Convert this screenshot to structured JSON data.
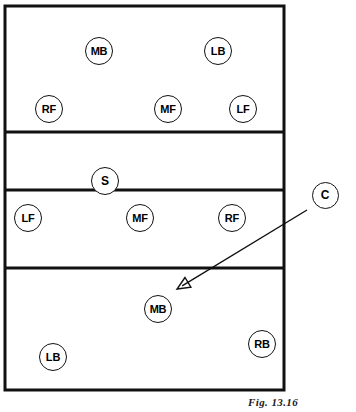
{
  "figure": {
    "caption": "Fig. 13.16"
  },
  "court": {
    "outline": {
      "x": 5,
      "y": 6,
      "width": 279,
      "height": 384
    },
    "lines": [
      {
        "name": "far-attack-line",
        "y": 132
      },
      {
        "name": "center-net-line",
        "y": 190
      },
      {
        "name": "near-attack-line",
        "y": 268
      }
    ],
    "line_color": "#111111"
  },
  "zones": [
    {
      "name": "far-back-zone",
      "top": 6,
      "bottom": 132
    },
    {
      "name": "far-front-zone",
      "top": 132,
      "bottom": 190
    },
    {
      "name": "near-front-zone",
      "top": 190,
      "bottom": 268
    },
    {
      "name": "near-back-zone",
      "top": 268,
      "bottom": 390
    }
  ],
  "players": [
    {
      "id": "far-mb",
      "label": "MB",
      "cx": 99,
      "cy": 51,
      "zone": "far-back-zone"
    },
    {
      "id": "far-lb",
      "label": "LB",
      "cx": 218,
      "cy": 51,
      "zone": "far-back-zone"
    },
    {
      "id": "far-rf",
      "label": "RF",
      "cx": 49,
      "cy": 109,
      "zone": "far-back-zone"
    },
    {
      "id": "far-mf",
      "label": "MF",
      "cx": 168,
      "cy": 109,
      "zone": "far-back-zone"
    },
    {
      "id": "far-lf",
      "label": "LF",
      "cx": 243,
      "cy": 109,
      "zone": "far-back-zone"
    },
    {
      "id": "setter",
      "label": "S",
      "cx": 105,
      "cy": 181,
      "zone": "far-front-zone"
    },
    {
      "id": "near-lf",
      "label": "LF",
      "cx": 28,
      "cy": 218,
      "zone": "near-front-zone"
    },
    {
      "id": "near-mf",
      "label": "MF",
      "cx": 140,
      "cy": 218,
      "zone": "near-front-zone"
    },
    {
      "id": "near-rf",
      "label": "RF",
      "cx": 232,
      "cy": 218,
      "zone": "near-front-zone"
    },
    {
      "id": "near-mb",
      "label": "MB",
      "cx": 158,
      "cy": 309,
      "zone": "near-back-zone"
    },
    {
      "id": "near-rb",
      "label": "RB",
      "cx": 262,
      "cy": 344,
      "zone": "near-back-zone"
    },
    {
      "id": "near-lb",
      "label": "LB",
      "cx": 53,
      "cy": 357,
      "zone": "near-back-zone"
    }
  ],
  "callout": {
    "label": "C",
    "cx": 325,
    "cy": 195,
    "arrow": {
      "from_x": 307,
      "from_y": 210,
      "to_x": 177,
      "to_y": 289,
      "name": "callout-arrow-to-near-mb"
    }
  }
}
